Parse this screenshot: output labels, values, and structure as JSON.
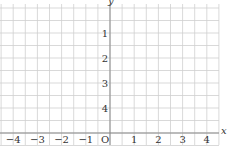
{
  "chart_data": {
    "type": "coordinate-grid",
    "title": "",
    "xlabel": "x",
    "ylabel": "y",
    "x_tick_labels": [
      "−4",
      "−3",
      "−2",
      "−1",
      "O",
      "1",
      "2",
      "3",
      "4"
    ],
    "y_tick_labels": [
      "4",
      "3",
      "2",
      "1"
    ],
    "x_ticks": [
      -4,
      -3,
      -2,
      -1,
      0,
      1,
      2,
      3,
      4
    ],
    "y_ticks": [
      1,
      2,
      3,
      4
    ],
    "xlim": [
      -4.5,
      4.5
    ],
    "ylim": [
      -0.5,
      5
    ],
    "grid": true,
    "grid_spacing": 0.5,
    "origin_label": "O",
    "series": []
  },
  "colors": {
    "grid": "#cfcfcf",
    "axis": "#8a8a8a",
    "text": "#333333"
  }
}
